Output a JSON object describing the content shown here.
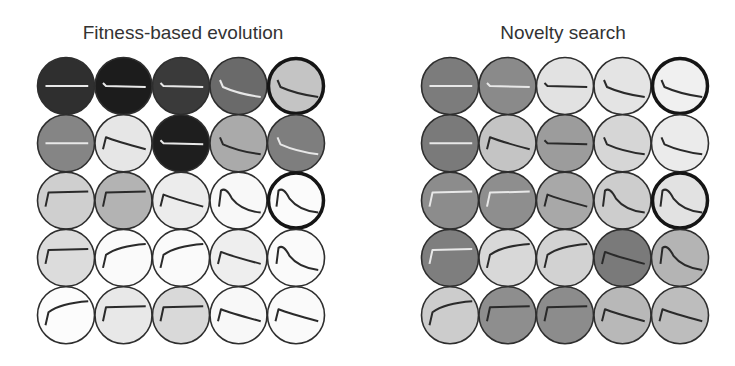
{
  "colors": {
    "background": "#ffffff",
    "outline": "#2e2e2e",
    "highlight_outline": "#151515",
    "dark_curve": "#2a2a2a",
    "light_curve": "#e8e8e8"
  },
  "layout": {
    "radius": 28.5,
    "col_step": 57.5,
    "row_step": 57.3
  },
  "panels": [
    {
      "id": "fitness",
      "title": "Fitness-based evolution",
      "title_center_x": 183,
      "origin_x": 66,
      "origin_y": 86,
      "grid": [
        [
          {
            "fill": "#2f2f2f",
            "curve": "flat",
            "line": "light"
          },
          {
            "fill": "#1c1c1c",
            "curve": "drop",
            "line": "light"
          },
          {
            "fill": "#3a3a3a",
            "curve": "drop",
            "line": "light"
          },
          {
            "fill": "#6a6a6a",
            "curve": "dropslope",
            "line": "light"
          },
          {
            "fill": "#c4c4c4",
            "curve": "dropslope",
            "line": "dark",
            "highlight": true
          }
        ],
        [
          {
            "fill": "#858585",
            "curve": "flat",
            "line": "light"
          },
          {
            "fill": "#e6e6e6",
            "curve": "decay",
            "line": "dark"
          },
          {
            "fill": "#1e1e1e",
            "curve": "drop",
            "line": "light"
          },
          {
            "fill": "#aaaaaa",
            "curve": "dropslope",
            "line": "dark"
          },
          {
            "fill": "#7e7e7e",
            "curve": "dropslope",
            "line": "light"
          }
        ],
        [
          {
            "fill": "#cfcfcf",
            "curve": "plateau",
            "line": "dark"
          },
          {
            "fill": "#b3b3b3",
            "curve": "plateau",
            "line": "dark"
          },
          {
            "fill": "#ececec",
            "curve": "decay",
            "line": "dark"
          },
          {
            "fill": "#f8f8f8",
            "curve": "peak",
            "line": "dark"
          },
          {
            "fill": "#fbfbfb",
            "curve": "peak",
            "line": "dark",
            "highlight": true
          }
        ],
        [
          {
            "fill": "#dcdcdc",
            "curve": "plateau",
            "line": "dark"
          },
          {
            "fill": "#fafafa",
            "curve": "rise",
            "line": "dark"
          },
          {
            "fill": "#fafafa",
            "curve": "rise",
            "line": "dark"
          },
          {
            "fill": "#eeeeee",
            "curve": "decay",
            "line": "dark"
          },
          {
            "fill": "#fafafa",
            "curve": "peak",
            "line": "dark"
          }
        ],
        [
          {
            "fill": "#fcfcfc",
            "curve": "rise",
            "line": "dark"
          },
          {
            "fill": "#e8e8e8",
            "curve": "plateau",
            "line": "dark"
          },
          {
            "fill": "#d9d9d9",
            "curve": "plateau",
            "line": "dark"
          },
          {
            "fill": "#f8f8f8",
            "curve": "decay",
            "line": "dark"
          },
          {
            "fill": "#fafafa",
            "curve": "decay",
            "line": "dark"
          }
        ]
      ]
    },
    {
      "id": "novelty",
      "title": "Novelty search",
      "title_center_x": 563,
      "origin_x": 450,
      "origin_y": 86,
      "grid": [
        [
          {
            "fill": "#7c7c7c",
            "curve": "flat",
            "line": "light"
          },
          {
            "fill": "#8a8a8a",
            "curve": "drop",
            "line": "light"
          },
          {
            "fill": "#e2e2e2",
            "curve": "drop",
            "line": "dark"
          },
          {
            "fill": "#e4e4e4",
            "curve": "dropslope",
            "line": "dark"
          },
          {
            "fill": "#f0f0f0",
            "curve": "dropslope",
            "line": "dark",
            "highlight": true
          }
        ],
        [
          {
            "fill": "#7a7a7a",
            "curve": "flat",
            "line": "light"
          },
          {
            "fill": "#c4c4c4",
            "curve": "decay",
            "line": "dark"
          },
          {
            "fill": "#9c9c9c",
            "curve": "drop",
            "line": "dark"
          },
          {
            "fill": "#d6d6d6",
            "curve": "dropslope",
            "line": "dark"
          },
          {
            "fill": "#ebebeb",
            "curve": "dropslope",
            "line": "dark"
          }
        ],
        [
          {
            "fill": "#8c8c8c",
            "curve": "plateau",
            "line": "light"
          },
          {
            "fill": "#8e8e8e",
            "curve": "plateau",
            "line": "light"
          },
          {
            "fill": "#a8a8a8",
            "curve": "decay",
            "line": "dark"
          },
          {
            "fill": "#cdcdcd",
            "curve": "peak",
            "line": "dark"
          },
          {
            "fill": "#e2e2e2",
            "curve": "peak",
            "line": "dark",
            "highlight": true
          }
        ],
        [
          {
            "fill": "#7e7e7e",
            "curve": "plateau",
            "line": "light"
          },
          {
            "fill": "#d8d8d8",
            "curve": "rise",
            "line": "dark"
          },
          {
            "fill": "#d2d2d2",
            "curve": "rise",
            "line": "dark"
          },
          {
            "fill": "#7a7a7a",
            "curve": "decay",
            "line": "dark"
          },
          {
            "fill": "#b4b4b4",
            "curve": "peak",
            "line": "dark"
          }
        ],
        [
          {
            "fill": "#cccccc",
            "curve": "rise",
            "line": "dark"
          },
          {
            "fill": "#8e8e8e",
            "curve": "plateau",
            "line": "dark"
          },
          {
            "fill": "#8c8c8c",
            "curve": "plateau",
            "line": "dark"
          },
          {
            "fill": "#b8b8b8",
            "curve": "decay",
            "line": "dark"
          },
          {
            "fill": "#bdbdbd",
            "curve": "decay",
            "line": "dark"
          }
        ]
      ]
    }
  ]
}
